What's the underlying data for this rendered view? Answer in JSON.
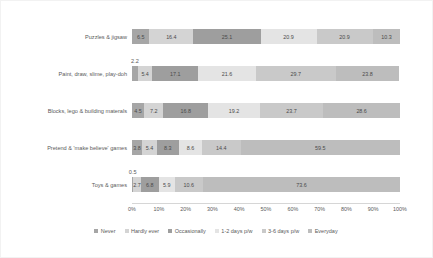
{
  "chart_data": {
    "type": "bar",
    "orientation": "horizontal",
    "stacked": true,
    "normalized": "100%",
    "title": "",
    "xlabel": "",
    "ylabel": "",
    "xlim": [
      0,
      100
    ],
    "grid": false,
    "legend_position": "bottom",
    "categories": [
      "Puzzles & jigsaw",
      "Paint, draw, slime, play-doh",
      "Blocks, lego & building materals",
      "Pretend & 'make believe' games",
      "Toys & games"
    ],
    "series": [
      {
        "name": "Never",
        "color": "#a6a6a6",
        "values": [
          6.5,
          2.2,
          4.5,
          3.8,
          0.5
        ]
      },
      {
        "name": "Hardly ever",
        "color": "#d4d4d4",
        "values": [
          16.4,
          5.4,
          7.2,
          5.4,
          2.7
        ]
      },
      {
        "name": "Occasionally",
        "color": "#9e9e9e",
        "values": [
          25.1,
          17.1,
          16.8,
          8.3,
          6.8
        ]
      },
      {
        "name": "1-2 days p/w",
        "color": "#e4e4e4",
        "values": [
          20.9,
          21.6,
          19.2,
          8.6,
          5.9
        ]
      },
      {
        "name": "3-6 days p/w",
        "color": "#c9c9c9",
        "values": [
          20.9,
          29.7,
          23.7,
          14.4,
          10.6
        ]
      },
      {
        "name": "Everyday",
        "color": "#bdbdbd",
        "values": [
          10.3,
          23.8,
          28.6,
          59.5,
          73.6
        ]
      }
    ],
    "xticks": [
      "0%",
      "10%",
      "20%",
      "30%",
      "40%",
      "50%",
      "60%",
      "70%",
      "80%",
      "90%",
      "100%"
    ],
    "xtick_values": [
      0,
      10,
      20,
      30,
      40,
      50,
      60,
      70,
      80,
      90,
      100
    ],
    "data_labels": [
      [
        "6.5",
        "16.4",
        "25.1",
        "20.9",
        "20.9",
        "10.3"
      ],
      [
        "2.2",
        "5.4",
        "17.1",
        "21.6",
        "29.7",
        "23.8"
      ],
      [
        "4.5",
        "7.2",
        "16.8",
        "19.2",
        "23.7",
        "28.6"
      ],
      [
        "3.8",
        "5.4",
        "8.3",
        "8.6",
        "14.4",
        "59.5"
      ],
      [
        "0.5",
        "2.7",
        "6.8",
        "5.9",
        "10.6",
        "73.6"
      ]
    ],
    "callouts": [
      {
        "category": "Paint, draw, slime, play-doh",
        "series": "Never",
        "label": "2.2"
      },
      {
        "category": "Toys & games",
        "series": "Never",
        "label": "0.5"
      }
    ]
  }
}
